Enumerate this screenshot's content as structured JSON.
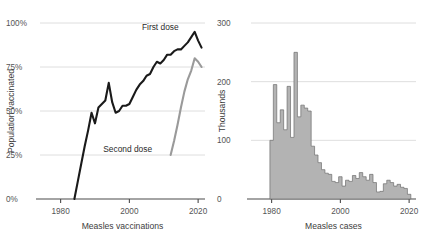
{
  "figure": {
    "background": "#ffffff",
    "width": 422,
    "height": 250
  },
  "colors": {
    "first_dose": "#1a1a1a",
    "second_dose": "#9a9a9a",
    "bar_fill": "#b3b3b3",
    "bar_edge": "#6e6e6e",
    "grid": "#d6d6d6",
    "axis": "#4a4a4a",
    "text": "#3d3d3d"
  },
  "panels": [
    {
      "id": "measles-vaccinations",
      "xlabel": "Measles vaccinations",
      "ylabel": "Population vaccinated",
      "yticklabels": [
        "100%",
        "75%",
        "50%",
        "25%",
        "0%"
      ],
      "xticklabels": [
        "1980",
        "2000",
        "2020"
      ],
      "annotations": [
        {
          "text": "First dose",
          "x": 2009.0,
          "y": 96.0
        },
        {
          "text": "Second dose",
          "x": 1999.5,
          "y": 26.5
        }
      ]
    },
    {
      "id": "measles-cases",
      "xlabel": "Measles cases",
      "ylabel": "Thousands",
      "yticklabels": [
        "300",
        "200",
        "100",
        "0"
      ],
      "xticklabels": [
        "1980",
        "2000",
        "2020"
      ],
      "annotations": []
    }
  ],
  "chart_data": [
    {
      "type": "line",
      "title": "",
      "xlabel": "Measles vaccinations",
      "ylabel": "Population vaccinated",
      "xlim": [
        1974,
        2022
      ],
      "ylim": [
        0,
        100
      ],
      "xticks": [
        1980,
        2000,
        2020
      ],
      "yticks": [
        0,
        25,
        50,
        75,
        100
      ],
      "ytick_labels": [
        "0%",
        "25%",
        "50%",
        "75%",
        "100%"
      ],
      "grid": true,
      "legend": "inline-annotations",
      "series": [
        {
          "name": "First dose",
          "color": "#1a1a1a",
          "x": [
            1984,
            1985,
            1986,
            1987,
            1988,
            1989,
            1990,
            1991,
            1992,
            1993,
            1994,
            1995,
            1996,
            1997,
            1998,
            1999,
            2000,
            2001,
            2002,
            2003,
            2004,
            2005,
            2006,
            2007,
            2008,
            2009,
            2010,
            2011,
            2012,
            2013,
            2014,
            2015,
            2016,
            2017,
            2018,
            2019,
            2020,
            2021
          ],
          "values": [
            0,
            10,
            20,
            30,
            39,
            49,
            43,
            52,
            54,
            56,
            66,
            55,
            49,
            50,
            53,
            53,
            54,
            58,
            62,
            65,
            67,
            70,
            71,
            75,
            78,
            77,
            79,
            82,
            82,
            84,
            85,
            85,
            87,
            89,
            92,
            95,
            90,
            86
          ]
        },
        {
          "name": "Second dose",
          "color": "#9a9a9a",
          "x": [
            2012,
            2013,
            2014,
            2015,
            2016,
            2017,
            2018,
            2019,
            2020,
            2021
          ],
          "values": [
            25,
            33,
            42,
            52,
            61,
            68,
            73,
            80,
            78,
            75
          ]
        }
      ]
    },
    {
      "type": "bar",
      "title": "",
      "xlabel": "Measles cases",
      "ylabel": "Thousands",
      "xlim": [
        1974,
        2022
      ],
      "ylim": [
        0,
        300
      ],
      "xticks": [
        1980,
        2000,
        2020
      ],
      "yticks": [
        0,
        100,
        200,
        300
      ],
      "ytick_labels": [
        "0",
        "100",
        "200",
        "300"
      ],
      "grid": true,
      "categories": [
        1980,
        1981,
        1982,
        1983,
        1984,
        1985,
        1986,
        1987,
        1988,
        1989,
        1990,
        1991,
        1992,
        1993,
        1994,
        1995,
        1996,
        1997,
        1998,
        1999,
        2000,
        2001,
        2002,
        2003,
        2004,
        2005,
        2006,
        2007,
        2008,
        2009,
        2010,
        2011,
        2012,
        2013,
        2014,
        2015,
        2016,
        2017,
        2018,
        2019,
        2020
      ],
      "values": [
        100,
        195,
        130,
        152,
        118,
        192,
        105,
        250,
        140,
        160,
        155,
        150,
        90,
        75,
        62,
        50,
        44,
        42,
        30,
        28,
        38,
        22,
        32,
        30,
        40,
        35,
        45,
        38,
        32,
        42,
        28,
        12,
        13,
        26,
        32,
        28,
        22,
        25,
        20,
        18,
        8
      ]
    }
  ]
}
